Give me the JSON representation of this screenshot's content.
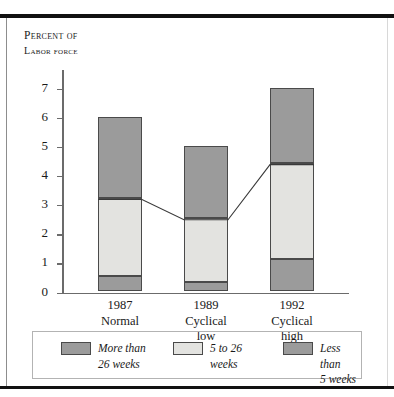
{
  "chart_data": {
    "type": "bar",
    "title": "",
    "axis_title_line1": "Percent of",
    "axis_title_line2": "Labor force",
    "xlabel": "",
    "ylabel": "Percent of labor force",
    "ylim": [
      0,
      7.6
    ],
    "yticks": [
      0,
      1,
      2,
      3,
      4,
      5,
      6,
      7
    ],
    "ytick_labels": [
      "0",
      "1",
      "2",
      "3",
      "4",
      "5",
      "6",
      "7"
    ],
    "grid": false,
    "legend_position": "bottom",
    "stacked": true,
    "categories": [
      "1987",
      "1989",
      "1992"
    ],
    "category_captions": [
      "Normal",
      "Cyclical\nlow",
      "Cyclical\nhigh"
    ],
    "series": [
      {
        "name": "Less than 5 weeks",
        "color": "#9b9b9b",
        "values": [
          0.5,
          0.3,
          1.1
        ]
      },
      {
        "name": "5 to 26 weeks",
        "color": "#e3e3e0",
        "values": [
          2.7,
          2.2,
          3.3
        ]
      },
      {
        "name": "More than 26 weeks",
        "color": "#9b9b9b",
        "values": [
          2.8,
          2.5,
          2.6
        ]
      }
    ],
    "totals": [
      6.0,
      5.0,
      7.0
    ],
    "overlay_line": {
      "name": "Cumulative through 26 weeks",
      "values": [
        3.2,
        2.5,
        4.4
      ],
      "color": "#3a3a3a"
    }
  },
  "legend": {
    "items": [
      {
        "label": "More than\n26 weeks",
        "swatch": "dark"
      },
      {
        "label": "5 to 26\nweeks",
        "swatch": "light"
      },
      {
        "label": "Less than\n5 weeks",
        "swatch": "medium"
      }
    ]
  },
  "x_axis": {
    "labels": [
      {
        "year": "1987",
        "caption": "Normal"
      },
      {
        "year": "1989",
        "caption": "Cyclical\nlow"
      },
      {
        "year": "1992",
        "caption": "Cyclical\nhigh"
      }
    ]
  }
}
